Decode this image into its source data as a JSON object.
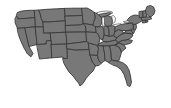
{
  "figure": {
    "kind": "map",
    "background_color": "#ffffff",
    "land_fill_color": "#787878",
    "border_color": "#3a3a3a",
    "water_color": "#ffffff",
    "projection_hint": "albers-usa-like",
    "width_px": 171,
    "height_px": 108,
    "legend_present": false,
    "labels_present": false
  },
  "map": {
    "region_name": "Contiguous United States",
    "state_count": 49,
    "water_bodies": [
      {
        "name": "Lake Superior",
        "id": "lake-superior"
      },
      {
        "name": "Lake Michigan",
        "id": "lake-michigan"
      },
      {
        "name": "Lake Huron",
        "id": "lake-huron"
      },
      {
        "name": "Lake Erie",
        "id": "lake-erie"
      },
      {
        "name": "Lake Ontario",
        "id": "lake-ontario"
      }
    ],
    "states": [
      {
        "id": "WA",
        "name": "Washington"
      },
      {
        "id": "OR",
        "name": "Oregon"
      },
      {
        "id": "CA",
        "name": "California"
      },
      {
        "id": "NV",
        "name": "Nevada"
      },
      {
        "id": "ID",
        "name": "Idaho"
      },
      {
        "id": "MT",
        "name": "Montana"
      },
      {
        "id": "WY",
        "name": "Wyoming"
      },
      {
        "id": "UT",
        "name": "Utah"
      },
      {
        "id": "AZ",
        "name": "Arizona"
      },
      {
        "id": "CO",
        "name": "Colorado"
      },
      {
        "id": "NM",
        "name": "New Mexico"
      },
      {
        "id": "ND",
        "name": "North Dakota"
      },
      {
        "id": "SD",
        "name": "South Dakota"
      },
      {
        "id": "NE",
        "name": "Nebraska"
      },
      {
        "id": "KS",
        "name": "Kansas"
      },
      {
        "id": "OK",
        "name": "Oklahoma"
      },
      {
        "id": "TX",
        "name": "Texas"
      },
      {
        "id": "MN",
        "name": "Minnesota"
      },
      {
        "id": "IA",
        "name": "Iowa"
      },
      {
        "id": "MO",
        "name": "Missouri"
      },
      {
        "id": "AR",
        "name": "Arkansas"
      },
      {
        "id": "LA",
        "name": "Louisiana"
      },
      {
        "id": "WI",
        "name": "Wisconsin"
      },
      {
        "id": "IL",
        "name": "Illinois"
      },
      {
        "id": "MI",
        "name": "Michigan"
      },
      {
        "id": "IN",
        "name": "Indiana"
      },
      {
        "id": "OH",
        "name": "Ohio"
      },
      {
        "id": "KY",
        "name": "Kentucky"
      },
      {
        "id": "TN",
        "name": "Tennessee"
      },
      {
        "id": "MS",
        "name": "Mississippi"
      },
      {
        "id": "AL",
        "name": "Alabama"
      },
      {
        "id": "GA",
        "name": "Georgia"
      },
      {
        "id": "FL",
        "name": "Florida"
      },
      {
        "id": "SC",
        "name": "South Carolina"
      },
      {
        "id": "NC",
        "name": "North Carolina"
      },
      {
        "id": "VA",
        "name": "Virginia"
      },
      {
        "id": "WV",
        "name": "West Virginia"
      },
      {
        "id": "MD",
        "name": "Maryland"
      },
      {
        "id": "DE",
        "name": "Delaware"
      },
      {
        "id": "PA",
        "name": "Pennsylvania"
      },
      {
        "id": "NJ",
        "name": "New Jersey"
      },
      {
        "id": "NY",
        "name": "New York"
      },
      {
        "id": "CT",
        "name": "Connecticut"
      },
      {
        "id": "RI",
        "name": "Rhode Island"
      },
      {
        "id": "MA",
        "name": "Massachusetts"
      },
      {
        "id": "VT",
        "name": "Vermont"
      },
      {
        "id": "NH",
        "name": "New Hampshire"
      },
      {
        "id": "ME",
        "name": "Maine"
      }
    ]
  }
}
